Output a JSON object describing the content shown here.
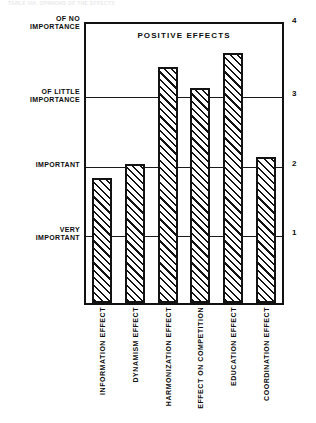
{
  "top_caption": "TABLE VIII.  OPINIONS OF THE EFFECTS",
  "chart_data": {
    "type": "bar",
    "title": "POSITIVE EFFECTS",
    "xlabel": "",
    "ylabel": "",
    "categories": [
      "INFORMATION EFFECT",
      "DYNAMISM EFFECT",
      "HARMONIZATION EFFECT",
      "EFFECT ON COMPETITION",
      "EDUCATION EFFECT",
      "COORDINATION EFFECT"
    ],
    "values": [
      1.8,
      2.0,
      3.4,
      3.1,
      3.6,
      2.1
    ],
    "ylim": [
      0,
      4
    ],
    "grid": true,
    "legend": "none",
    "y_right_ticks": [
      {
        "value": 4,
        "label": "4"
      },
      {
        "value": 3,
        "label": "3"
      },
      {
        "value": 2,
        "label": "2"
      },
      {
        "value": 1,
        "label": "1"
      }
    ],
    "y_left_ticks": [
      {
        "value": 4,
        "label": "OF NO\nIMPORTANCE"
      },
      {
        "value": 3,
        "label": "OF LITTLE\nIMPORTANCE"
      },
      {
        "value": 2,
        "label": "IMPORTANT"
      },
      {
        "value": 1,
        "label": "VERY\nIMPORTANT"
      }
    ],
    "bar_fill": "diagonal-hatch",
    "bar_color": "#131313",
    "background": "#ffffff"
  }
}
